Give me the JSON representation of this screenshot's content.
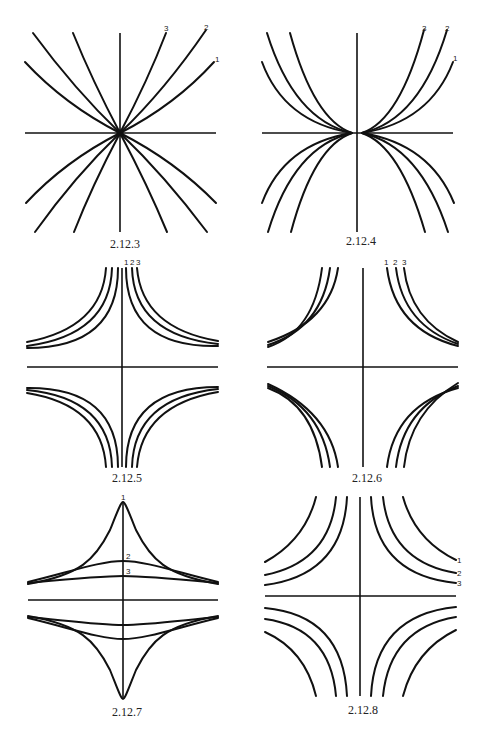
{
  "page": {
    "figures": [
      {
        "id": "2.12.3",
        "caption": "2.12.3",
        "curve_labels": [
          "3",
          "2",
          "1"
        ]
      },
      {
        "id": "2.12.4",
        "caption": "2.12.4",
        "curve_labels": [
          "3",
          "2",
          "1"
        ]
      },
      {
        "id": "2.12.5",
        "caption": "2.12.5",
        "curve_labels": [
          "1",
          "2",
          "3"
        ]
      },
      {
        "id": "2.12.6",
        "caption": "2.12.6",
        "curve_labels": [
          "1",
          "2",
          "3"
        ]
      },
      {
        "id": "2.12.7",
        "caption": "2.12.7",
        "curve_labels": [
          "1",
          "2",
          "3"
        ]
      },
      {
        "id": "2.12.8",
        "caption": "2.12.8",
        "curve_labels": [
          "1",
          "2",
          "3"
        ]
      }
    ]
  }
}
